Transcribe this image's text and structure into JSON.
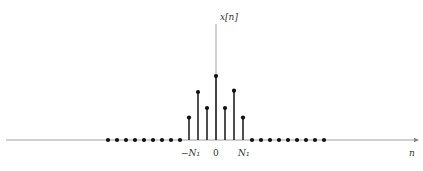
{
  "diagram": {
    "y_axis_label": "x[n]",
    "x_axis_label": "n",
    "tick_labels": {
      "left": "−N₁",
      "center": "0",
      "right": "N₁"
    },
    "colors": {
      "stem": "#222222",
      "axis": "#888888",
      "text": "#333333"
    }
  },
  "chart_data": {
    "type": "stem",
    "title": "",
    "xlabel": "n",
    "ylabel": "x[n]",
    "n": [
      -12,
      -11,
      -10,
      -9,
      -8,
      -7,
      -6,
      -5,
      -4,
      -3,
      -2,
      -1,
      0,
      1,
      2,
      3,
      4,
      5,
      6,
      7,
      8,
      9,
      10,
      11,
      12
    ],
    "values": [
      0,
      0,
      0,
      0,
      0,
      0,
      0,
      0,
      0,
      0.35,
      0.75,
      0.5,
      1.0,
      0.5,
      0.77,
      0.35,
      0,
      0,
      0,
      0,
      0,
      0,
      0,
      0,
      0
    ],
    "annotations": [
      "-N1 at n=-3",
      "N1 at n=3"
    ],
    "grid": false
  }
}
